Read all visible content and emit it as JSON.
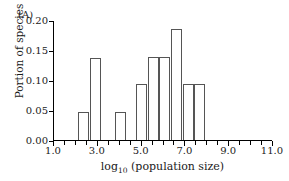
{
  "figure": {
    "panel_label": "(A)",
    "ylabel": "Portion of species",
    "xlabel_main": "log",
    "xlabel_sub": "10",
    "xlabel_rest": " (population size)"
  },
  "chart_data": {
    "type": "bar",
    "title": "(A)",
    "xlabel": "log10 (population size)",
    "ylabel": "Portion of species",
    "xlim": [
      1.0,
      11.0
    ],
    "ylim": [
      0.0,
      0.2
    ],
    "grid": false,
    "legend": null,
    "bin_width": 0.5,
    "xticks": [
      1.0,
      3.0,
      5.0,
      7.0,
      9.0,
      11.0
    ],
    "xtick_labels": [
      "1.0",
      "3.0",
      "5.0",
      "7.0",
      "9.0",
      "11.0"
    ],
    "xtick_minor_step": 0.5,
    "yticks": [
      0.0,
      0.05,
      0.1,
      0.15,
      0.2
    ],
    "ytick_labels": [
      "0.00",
      "0.05",
      "0.10",
      "0.15",
      "0.20"
    ],
    "bars": [
      {
        "x_start": 2.15,
        "x_end": 2.65,
        "value": 0.046
      },
      {
        "x_start": 2.7,
        "x_end": 3.2,
        "value": 0.137
      },
      {
        "x_start": 3.85,
        "x_end": 4.35,
        "value": 0.047
      },
      {
        "x_start": 4.8,
        "x_end": 5.3,
        "value": 0.093
      },
      {
        "x_start": 5.32,
        "x_end": 5.82,
        "value": 0.138
      },
      {
        "x_start": 5.86,
        "x_end": 6.36,
        "value": 0.138
      },
      {
        "x_start": 6.38,
        "x_end": 6.88,
        "value": 0.185
      },
      {
        "x_start": 6.92,
        "x_end": 7.42,
        "value": 0.093
      },
      {
        "x_start": 7.45,
        "x_end": 7.95,
        "value": 0.094
      }
    ],
    "categories": [
      "2.4",
      "2.95",
      "4.1",
      "5.05",
      "5.57",
      "6.11",
      "6.63",
      "7.17",
      "7.70"
    ],
    "values": [
      0.046,
      0.137,
      0.047,
      0.093,
      0.138,
      0.138,
      0.185,
      0.093,
      0.094
    ]
  }
}
